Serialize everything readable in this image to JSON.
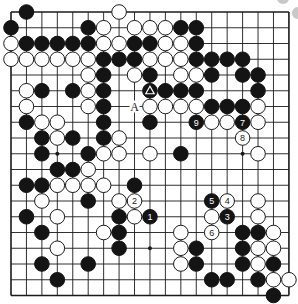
{
  "diagram": {
    "type": "go-board",
    "size": 19,
    "origin_px": {
      "x": 11,
      "y": 12
    },
    "spacing_px": {
      "x": 15.44,
      "y": 15.75
    },
    "stone_radius_px": 7.3,
    "colors": {
      "background": "#ffffff",
      "line": "#1a1a1a",
      "black_stone": "#141414",
      "white_stone": "#ffffff",
      "white_stone_border": "#1a1a1a",
      "label_on_black": "#ffffff",
      "label_on_white": "#1a1a1a",
      "decor_gray": "#c8c8c8"
    },
    "star_points": [
      [
        3,
        3
      ],
      [
        9,
        3
      ],
      [
        15,
        3
      ],
      [
        3,
        9
      ],
      [
        9,
        9
      ],
      [
        15,
        9
      ],
      [
        3,
        15
      ],
      [
        9,
        15
      ],
      [
        15,
        15
      ]
    ],
    "stones": [
      {
        "c": 1,
        "r": 0,
        "color": "B"
      },
      {
        "c": 7,
        "r": 0,
        "color": "W"
      },
      {
        "c": 0,
        "r": 1,
        "color": "B"
      },
      {
        "c": 5,
        "r": 1,
        "color": "B"
      },
      {
        "c": 6,
        "r": 1,
        "color": "W"
      },
      {
        "c": 8,
        "r": 1,
        "color": "W"
      },
      {
        "c": 9,
        "r": 1,
        "color": "W"
      },
      {
        "c": 10,
        "r": 1,
        "color": "W"
      },
      {
        "c": 11,
        "r": 1,
        "color": "B"
      },
      {
        "c": 12,
        "r": 1,
        "color": "B"
      },
      {
        "c": 0,
        "r": 2,
        "color": "W"
      },
      {
        "c": 1,
        "r": 2,
        "color": "B"
      },
      {
        "c": 2,
        "r": 2,
        "color": "B"
      },
      {
        "c": 3,
        "r": 2,
        "color": "B"
      },
      {
        "c": 4,
        "r": 2,
        "color": "B"
      },
      {
        "c": 5,
        "r": 2,
        "color": "B"
      },
      {
        "c": 6,
        "r": 2,
        "color": "W"
      },
      {
        "c": 7,
        "r": 2,
        "color": "W"
      },
      {
        "c": 8,
        "r": 2,
        "color": "B"
      },
      {
        "c": 9,
        "r": 2,
        "color": "B"
      },
      {
        "c": 10,
        "r": 2,
        "color": "W"
      },
      {
        "c": 11,
        "r": 2,
        "color": "W"
      },
      {
        "c": 12,
        "r": 2,
        "color": "B"
      },
      {
        "c": 0,
        "r": 3,
        "color": "W"
      },
      {
        "c": 1,
        "r": 3,
        "color": "W"
      },
      {
        "c": 2,
        "r": 3,
        "color": "W"
      },
      {
        "c": 3,
        "r": 3,
        "color": "W"
      },
      {
        "c": 4,
        "r": 3,
        "color": "W"
      },
      {
        "c": 5,
        "r": 3,
        "color": "W"
      },
      {
        "c": 6,
        "r": 3,
        "color": "B"
      },
      {
        "c": 7,
        "r": 3,
        "color": "B"
      },
      {
        "c": 8,
        "r": 3,
        "color": "B"
      },
      {
        "c": 9,
        "r": 3,
        "color": "W"
      },
      {
        "c": 10,
        "r": 3,
        "color": "W"
      },
      {
        "c": 11,
        "r": 3,
        "color": "W"
      },
      {
        "c": 12,
        "r": 3,
        "color": "B"
      },
      {
        "c": 13,
        "r": 3,
        "color": "B"
      },
      {
        "c": 14,
        "r": 3,
        "color": "B"
      },
      {
        "c": 15,
        "r": 3,
        "color": "B"
      },
      {
        "c": 5,
        "r": 4,
        "color": "W"
      },
      {
        "c": 6,
        "r": 4,
        "color": "B"
      },
      {
        "c": 8,
        "r": 4,
        "color": "W"
      },
      {
        "c": 9,
        "r": 4,
        "color": "B"
      },
      {
        "c": 11,
        "r": 4,
        "color": "W"
      },
      {
        "c": 12,
        "r": 4,
        "color": "W"
      },
      {
        "c": 13,
        "r": 4,
        "color": "B"
      },
      {
        "c": 15,
        "r": 4,
        "color": "B"
      },
      {
        "c": 16,
        "r": 4,
        "color": "B"
      },
      {
        "c": 1,
        "r": 5,
        "color": "W"
      },
      {
        "c": 2,
        "r": 5,
        "color": "B"
      },
      {
        "c": 4,
        "r": 5,
        "color": "B"
      },
      {
        "c": 5,
        "r": 5,
        "color": "W"
      },
      {
        "c": 6,
        "r": 5,
        "color": "B"
      },
      {
        "c": 9,
        "r": 5,
        "color": "B",
        "mark": "triangle"
      },
      {
        "c": 10,
        "r": 5,
        "color": "B"
      },
      {
        "c": 11,
        "r": 5,
        "color": "B"
      },
      {
        "c": 12,
        "r": 5,
        "color": "B"
      },
      {
        "c": 16,
        "r": 5,
        "color": "B"
      },
      {
        "c": 1,
        "r": 6,
        "color": "W"
      },
      {
        "c": 5,
        "r": 6,
        "color": "W"
      },
      {
        "c": 6,
        "r": 6,
        "color": "B"
      },
      {
        "c": 9,
        "r": 6,
        "color": "W"
      },
      {
        "c": 10,
        "r": 6,
        "color": "W"
      },
      {
        "c": 11,
        "r": 6,
        "color": "W"
      },
      {
        "c": 12,
        "r": 6,
        "color": "W"
      },
      {
        "c": 13,
        "r": 6,
        "color": "B"
      },
      {
        "c": 14,
        "r": 6,
        "color": "B"
      },
      {
        "c": 15,
        "r": 6,
        "color": "B"
      },
      {
        "c": 16,
        "r": 6,
        "color": "W"
      },
      {
        "c": 1,
        "r": 7,
        "color": "B"
      },
      {
        "c": 2,
        "r": 7,
        "color": "W"
      },
      {
        "c": 3,
        "r": 7,
        "color": "W"
      },
      {
        "c": 6,
        "r": 7,
        "color": "B"
      },
      {
        "c": 9,
        "r": 7,
        "color": "B"
      },
      {
        "c": 12,
        "r": 7,
        "color": "B",
        "label": "9"
      },
      {
        "c": 13,
        "r": 7,
        "color": "W"
      },
      {
        "c": 14,
        "r": 7,
        "color": "W"
      },
      {
        "c": 15,
        "r": 7,
        "color": "B",
        "label": "7"
      },
      {
        "c": 16,
        "r": 7,
        "color": "W"
      },
      {
        "c": 2,
        "r": 8,
        "color": "B"
      },
      {
        "c": 3,
        "r": 8,
        "color": "W"
      },
      {
        "c": 4,
        "r": 8,
        "color": "B"
      },
      {
        "c": 6,
        "r": 8,
        "color": "B"
      },
      {
        "c": 7,
        "r": 8,
        "color": "W"
      },
      {
        "c": 15,
        "r": 8,
        "color": "W",
        "label": "8"
      },
      {
        "c": 2,
        "r": 9,
        "color": "B"
      },
      {
        "c": 5,
        "r": 9,
        "color": "B"
      },
      {
        "c": 6,
        "r": 9,
        "color": "W"
      },
      {
        "c": 7,
        "r": 9,
        "color": "W"
      },
      {
        "c": 9,
        "r": 9,
        "color": "W"
      },
      {
        "c": 11,
        "r": 9,
        "color": "B"
      },
      {
        "c": 16,
        "r": 9,
        "color": "W"
      },
      {
        "c": 3,
        "r": 10,
        "color": "B"
      },
      {
        "c": 4,
        "r": 10,
        "color": "B"
      },
      {
        "c": 5,
        "r": 10,
        "color": "W"
      },
      {
        "c": 1,
        "r": 11,
        "color": "B"
      },
      {
        "c": 2,
        "r": 11,
        "color": "B"
      },
      {
        "c": 3,
        "r": 11,
        "color": "W"
      },
      {
        "c": 4,
        "r": 11,
        "color": "W"
      },
      {
        "c": 5,
        "r": 11,
        "color": "W"
      },
      {
        "c": 6,
        "r": 11,
        "color": "W"
      },
      {
        "c": 8,
        "r": 11,
        "color": "B"
      },
      {
        "c": 2,
        "r": 12,
        "color": "W"
      },
      {
        "c": 5,
        "r": 12,
        "color": "B"
      },
      {
        "c": 7,
        "r": 12,
        "color": "W"
      },
      {
        "c": 8,
        "r": 12,
        "color": "W",
        "label": "2"
      },
      {
        "c": 13,
        "r": 12,
        "color": "B",
        "label": "5"
      },
      {
        "c": 14,
        "r": 12,
        "color": "W",
        "label": "4"
      },
      {
        "c": 16,
        "r": 12,
        "color": "W"
      },
      {
        "c": 1,
        "r": 13,
        "color": "B"
      },
      {
        "c": 3,
        "r": 13,
        "color": "W"
      },
      {
        "c": 7,
        "r": 13,
        "color": "B"
      },
      {
        "c": 8,
        "r": 13,
        "color": "W"
      },
      {
        "c": 9,
        "r": 13,
        "color": "B",
        "label": "1"
      },
      {
        "c": 13,
        "r": 13,
        "color": "W"
      },
      {
        "c": 14,
        "r": 13,
        "color": "B",
        "label": "3"
      },
      {
        "c": 16,
        "r": 13,
        "color": "W"
      },
      {
        "c": 2,
        "r": 14,
        "color": "B"
      },
      {
        "c": 6,
        "r": 14,
        "color": "W"
      },
      {
        "c": 7,
        "r": 14,
        "color": "B"
      },
      {
        "c": 11,
        "r": 14,
        "color": "W"
      },
      {
        "c": 13,
        "r": 14,
        "color": "W",
        "label": "6"
      },
      {
        "c": 15,
        "r": 14,
        "color": "B"
      },
      {
        "c": 16,
        "r": 14,
        "color": "B"
      },
      {
        "c": 17,
        "r": 14,
        "color": "W"
      },
      {
        "c": 3,
        "r": 15,
        "color": "W"
      },
      {
        "c": 7,
        "r": 15,
        "color": "B"
      },
      {
        "c": 11,
        "r": 15,
        "color": "W"
      },
      {
        "c": 12,
        "r": 15,
        "color": "B"
      },
      {
        "c": 15,
        "r": 15,
        "color": "B"
      },
      {
        "c": 16,
        "r": 15,
        "color": "W"
      },
      {
        "c": 17,
        "r": 15,
        "color": "W"
      },
      {
        "c": 2,
        "r": 16,
        "color": "B"
      },
      {
        "c": 5,
        "r": 16,
        "color": "B"
      },
      {
        "c": 11,
        "r": 16,
        "color": "W"
      },
      {
        "c": 12,
        "r": 16,
        "color": "B"
      },
      {
        "c": 15,
        "r": 16,
        "color": "B"
      },
      {
        "c": 16,
        "r": 16,
        "color": "W"
      },
      {
        "c": 17,
        "r": 16,
        "color": "B"
      },
      {
        "c": 3,
        "r": 17,
        "color": "B"
      },
      {
        "c": 13,
        "r": 17,
        "color": "B"
      },
      {
        "c": 14,
        "r": 17,
        "color": "B"
      },
      {
        "c": 16,
        "r": 17,
        "color": "B"
      },
      {
        "c": 17,
        "r": 17,
        "color": "W"
      },
      {
        "c": 18,
        "r": 17,
        "color": "W"
      },
      {
        "c": 17,
        "r": 18,
        "color": "B"
      }
    ],
    "point_labels": [
      {
        "c": 8,
        "r": 6,
        "text": "A"
      }
    ],
    "decorations": [
      {
        "x": 283,
        "y": -2,
        "r": 6
      },
      {
        "x": 298,
        "y": 13,
        "r": 6
      }
    ]
  }
}
